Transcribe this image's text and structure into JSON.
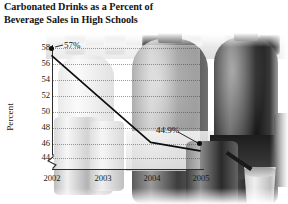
{
  "title": {
    "line1": "Carbonated Drinks as a Percent of",
    "line2": "Beverage Sales in High Schools"
  },
  "axes": {
    "ylabel": "Percent",
    "yticks": [
      "58",
      "56",
      "54",
      "52",
      "50",
      "48",
      "46",
      "44"
    ],
    "xticks": [
      "2002",
      "2003",
      "2004",
      "2005"
    ],
    "axis_break_present": true
  },
  "annotations": {
    "first_point_label": "57%",
    "last_point_label": "44.9%"
  },
  "colors": {
    "line": "#0d0d0d",
    "marker": "#0d0d0d",
    "text": "#141414",
    "grid": "#3c3c3c",
    "background": "#ffffff"
  },
  "chart_data": {
    "type": "line",
    "title": "Carbonated Drinks as a Percent of Beverage Sales in High Schools",
    "xlabel": "",
    "ylabel": "Percent",
    "x": [
      "2002",
      "2003",
      "2004",
      "2005"
    ],
    "values": [
      57,
      51.5,
      46,
      44.9
    ],
    "point_labels": [
      "57%",
      "",
      "",
      "44.9%"
    ],
    "ylim": [
      44,
      58
    ],
    "ytick_step": 2,
    "grid": true,
    "legend": "none",
    "axis_break": "y-axis broken below 44",
    "background_image": "grayscale photo of soda bottles, cans and a cup"
  }
}
